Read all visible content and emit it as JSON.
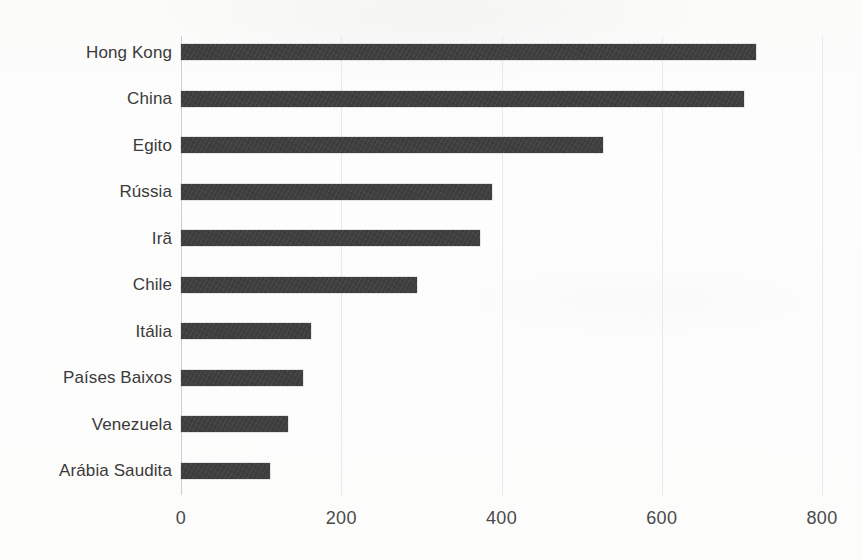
{
  "chart_data": {
    "type": "bar",
    "orientation": "horizontal",
    "title": "",
    "subtitle": "",
    "xlabel": "",
    "ylabel": "",
    "xlim": [
      0,
      800
    ],
    "ylim": null,
    "grid": true,
    "legend": null,
    "legend_position": "none",
    "bar_color": "#3f3f3f",
    "gridline_color": "#e9e9e9",
    "axis_color": "#cfcfcf",
    "background_color": "#fdfdfc",
    "text_color": "#3a3a3a",
    "xticks": [
      0,
      200,
      400,
      600,
      800
    ],
    "xtick_labels": [
      "0",
      "200",
      "400",
      "600",
      "800"
    ],
    "categories": [
      "Hong Kong",
      "China",
      "Egito",
      "Rússia",
      "Irã",
      "Chile",
      "Itália",
      "Países Baixos",
      "Venezuela",
      "Arábia Saudita"
    ],
    "values": [
      718,
      703,
      527,
      388,
      373,
      295,
      162,
      152,
      134,
      111
    ],
    "bars": [
      {
        "category": "Hong Kong",
        "value": 718
      },
      {
        "category": "China",
        "value": 703
      },
      {
        "category": "Egito",
        "value": 527
      },
      {
        "category": "Rússia",
        "value": 388
      },
      {
        "category": "Irã",
        "value": 373
      },
      {
        "category": "Chile",
        "value": 295
      },
      {
        "category": "Itália",
        "value": 162
      },
      {
        "category": "Países Baixos",
        "value": 152
      },
      {
        "category": "Venezuela",
        "value": 134
      },
      {
        "category": "Arábia Saudita",
        "value": 111
      }
    ]
  }
}
